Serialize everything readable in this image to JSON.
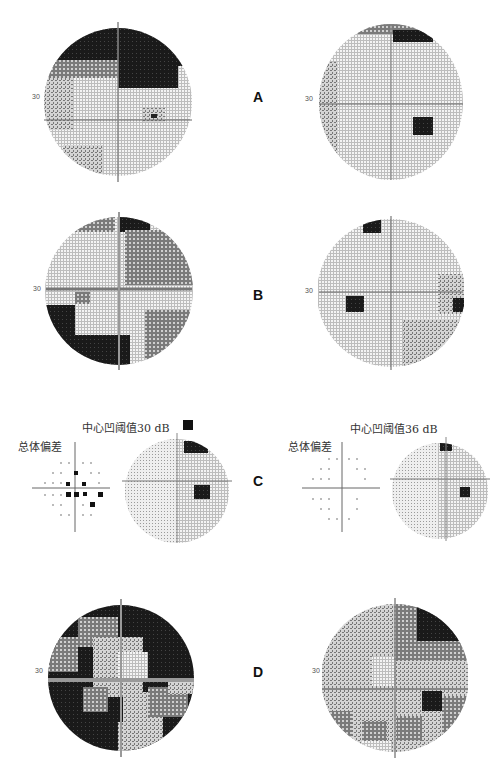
{
  "figure": {
    "panels": [
      {
        "id": "A",
        "label": "A",
        "left_axis_label": "30",
        "right_axis_label": "30"
      },
      {
        "id": "B",
        "label": "B",
        "left_axis_label": "30",
        "right_axis_label": "30"
      },
      {
        "id": "C",
        "label": "C",
        "left_title": "中心凹阈值30 dB",
        "right_title": "中心凹阈值36 dB",
        "left_subtitle": "总体偏差",
        "right_subtitle": "总体偏差"
      },
      {
        "id": "D",
        "label": "D",
        "left_axis_label": "30",
        "right_axis_label": "30"
      }
    ],
    "colors": {
      "background": "#ffffff",
      "severe_defect": "#111111",
      "moderate_defect": "#555555",
      "mild_defect": "#a0a0a0",
      "normal": "#dcdcdc",
      "axis": "#666666"
    }
  }
}
